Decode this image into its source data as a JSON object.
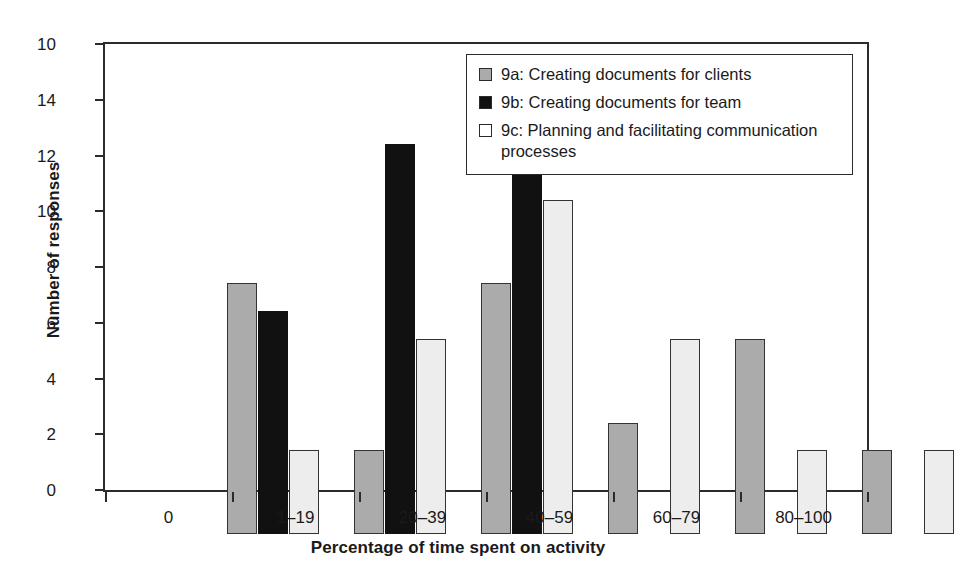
{
  "chart_data": {
    "type": "bar",
    "title": "",
    "xlabel": "Percentage of time spent on activity",
    "ylabel": "Number of responses",
    "categories": [
      "0",
      "1–19",
      "20–39",
      "40–59",
      "60–79",
      "80–100"
    ],
    "ylim": [
      0,
      16
    ],
    "yticks": [
      "0",
      "2",
      "4",
      "6",
      "8",
      "10",
      "12",
      "14",
      "16"
    ],
    "ytick_display": [
      "0",
      "2",
      "4",
      "6",
      "8",
      "10",
      "12",
      "14",
      "10"
    ],
    "grid": false,
    "legend_position": "top-right",
    "series": [
      {
        "name": "9a: Creating documents for clients",
        "key": "series-a",
        "color": "#ababab",
        "values": [
          9,
          3,
          9,
          4,
          7,
          3
        ]
      },
      {
        "name": "9b: Creating documents for team",
        "key": "series-b",
        "color": "#111111",
        "values": [
          8,
          14,
          13,
          null,
          null,
          null
        ]
      },
      {
        "name": "9c: Planning and facilitating communication processes",
        "key": "series-c",
        "color": "#ededed",
        "values": [
          3,
          7,
          12,
          7,
          3,
          3
        ]
      }
    ]
  },
  "axes": {
    "y_title": "Number of responses",
    "x_title": "Percentage of time spent on activity"
  },
  "legend": {
    "entries": [
      {
        "swatch": "series-a",
        "label": "9a: Creating documents for clients"
      },
      {
        "swatch": "series-b",
        "label": "9b: Creating documents for team"
      },
      {
        "swatch": "series-c",
        "label": "9c: Planning and facilitating communication processes"
      }
    ]
  },
  "colors": {
    "series_a": "#ababab",
    "series_b": "#111111",
    "series_c": "#ededed",
    "axis": "#2b2b2b",
    "background": "#ffffff"
  }
}
